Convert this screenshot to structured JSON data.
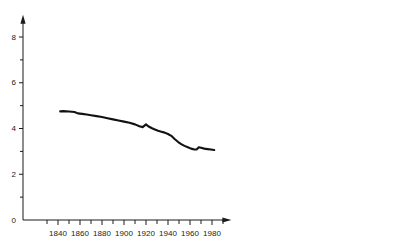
{
  "chart_data": {
    "type": "line",
    "title": "",
    "subtitle": "",
    "xlabel": "",
    "ylabel": "",
    "xlim": [
      1825,
      1995
    ],
    "ylim": [
      0,
      8.8
    ],
    "grid": false,
    "legend": null,
    "x_ticks_major": [
      1840,
      1860,
      1880,
      1900,
      1920,
      1940,
      1960,
      1980
    ],
    "x_ticks_minor": [
      1830,
      1850,
      1870,
      1890,
      1910,
      1930,
      1950,
      1970,
      1990
    ],
    "x_ticklabels": [
      "1840",
      "1860",
      "1880",
      "1900",
      "1920",
      "1940",
      "1960",
      "1980"
    ],
    "y_ticks_major": [
      0,
      2,
      4,
      6,
      8
    ],
    "y_ticks_minor": [
      1,
      3,
      5,
      7
    ],
    "y_ticklabels": [
      "0",
      "2",
      "4",
      "6",
      "8"
    ],
    "series": [
      {
        "name": "series-1",
        "color": "#121212",
        "x": [
          1842,
          1845,
          1850,
          1855,
          1858,
          1862,
          1866,
          1870,
          1875,
          1880,
          1885,
          1890,
          1895,
          1900,
          1905,
          1910,
          1914,
          1917,
          1920,
          1922,
          1925,
          1928,
          1931,
          1934,
          1937,
          1940,
          1943,
          1946,
          1949,
          1952,
          1955,
          1958,
          1961,
          1964,
          1966,
          1968,
          1970,
          1973,
          1976,
          1979,
          1982
        ],
        "y": [
          4.75,
          4.76,
          4.74,
          4.72,
          4.66,
          4.64,
          4.61,
          4.58,
          4.54,
          4.5,
          4.45,
          4.4,
          4.35,
          4.3,
          4.25,
          4.18,
          4.1,
          4.06,
          4.18,
          4.1,
          4.02,
          3.96,
          3.9,
          3.86,
          3.82,
          3.76,
          3.68,
          3.54,
          3.42,
          3.32,
          3.24,
          3.18,
          3.12,
          3.08,
          3.08,
          3.18,
          3.16,
          3.12,
          3.1,
          3.08,
          3.06
        ]
      }
    ],
    "axis_color": "#1a1a1a",
    "background": "#ffffff"
  }
}
